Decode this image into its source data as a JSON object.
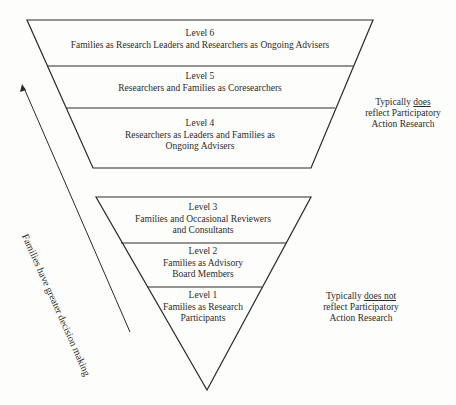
{
  "top_section": {
    "levels": [
      {
        "title": "Level 6",
        "desc": "Families as Research Leaders and Researchers as Ongoing Advisers"
      },
      {
        "title": "Level 5",
        "desc": "Researchers and Families as Coresearchers"
      },
      {
        "title": "Level 4",
        "desc_line1": "Researchers as Leaders and Families as",
        "desc_line2": "Ongoing Advisers"
      }
    ],
    "note": {
      "prefix": "Typically ",
      "emph": "does",
      "line2": "reflect Participatory",
      "line3": "Action Research"
    }
  },
  "bottom_section": {
    "levels": [
      {
        "title": "Level 3",
        "desc_line1": "Families and Occasional Reviewers",
        "desc_line2": "and Consultants"
      },
      {
        "title": "Level 2",
        "desc_line1": "Families as Advisory",
        "desc_line2": "Board Members"
      },
      {
        "title": "Level 1",
        "desc_line1": "Families as Research",
        "desc_line2": "Participants"
      }
    ],
    "note": {
      "prefix": "Typically ",
      "emph": "does not",
      "line2": "reflect Participatory",
      "line3": "Action Research"
    }
  },
  "arrow": {
    "label": "Families have greater decision making"
  },
  "colors": {
    "stroke": "#2a2a2a",
    "background": "#fdfdfb"
  }
}
